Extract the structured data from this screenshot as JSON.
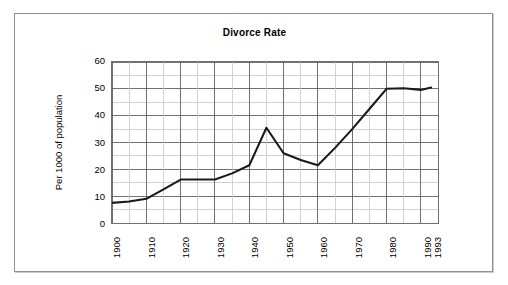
{
  "chart_data": {
    "type": "line",
    "title": "Divorce Rate",
    "xlabel": "",
    "ylabel": "Per 1000 of population",
    "ylim": [
      0,
      60
    ],
    "xlim": [
      1900,
      1993
    ],
    "y_ticks": [
      60,
      50,
      40,
      30,
      20,
      10,
      0
    ],
    "x_ticks": [
      "1900",
      "1910",
      "1920",
      "1930",
      "1940",
      "1950",
      "1960",
      "1970",
      "1980",
      "1990",
      "1993"
    ],
    "grid": "major and minor gridlines, 5-year minor on x, 5-unit minor on y",
    "legend": "none",
    "line_color": "#1a1a1a",
    "x": [
      1900,
      1905,
      1910,
      1915,
      1920,
      1925,
      1930,
      1935,
      1940,
      1945,
      1950,
      1955,
      1960,
      1965,
      1970,
      1975,
      1980,
      1985,
      1990,
      1993
    ],
    "values": [
      7.5,
      8.0,
      9.0,
      12.5,
      16.2,
      16.2,
      16.2,
      18.5,
      21.5,
      35.5,
      26.0,
      23.5,
      21.5,
      28.0,
      35.0,
      42.5,
      50.0,
      50.2,
      49.6,
      50.5
    ],
    "series": [
      {
        "name": "Divorce Rate",
        "values": [
          7.5,
          8.0,
          9.0,
          12.5,
          16.2,
          16.2,
          16.2,
          18.5,
          21.5,
          35.5,
          26.0,
          23.5,
          21.5,
          28.0,
          35.0,
          42.5,
          50.0,
          50.2,
          49.6,
          50.5
        ]
      }
    ],
    "annotations": []
  },
  "colors": {
    "frame_border": "#8d8f92",
    "plot_border": "#6e7073",
    "grid_major": "#5f6164",
    "grid_minor": "#c4c6c8",
    "line": "#1a1a1a",
    "text": "#000000",
    "background": "#ffffff"
  }
}
